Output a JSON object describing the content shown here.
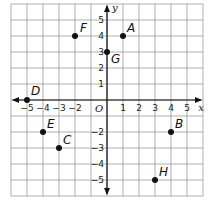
{
  "chart_data": {
    "type": "scatter",
    "title": "",
    "xlabel": "x",
    "ylabel": "y",
    "origin_label": "O",
    "xlim": [
      -6,
      6
    ],
    "ylim": [
      -6,
      6
    ],
    "grid": true,
    "x_ticks": [
      -5,
      -4,
      -3,
      -2,
      1,
      2,
      3,
      4,
      5
    ],
    "y_ticks": [
      5,
      4,
      3,
      2,
      1,
      -2,
      -3,
      -4,
      -5
    ],
    "points": [
      {
        "label": "A",
        "x": 1,
        "y": 4
      },
      {
        "label": "B",
        "x": 4,
        "y": -2
      },
      {
        "label": "C",
        "x": -3,
        "y": -3
      },
      {
        "label": "D",
        "x": -5,
        "y": 0
      },
      {
        "label": "E",
        "x": -4,
        "y": -2
      },
      {
        "label": "F",
        "x": -2,
        "y": 4
      },
      {
        "label": "G",
        "x": 0,
        "y": 3
      },
      {
        "label": "H",
        "x": 3,
        "y": -5
      }
    ]
  },
  "colors": {
    "grid": "#9a9a9a",
    "axis": "#111111",
    "point": "#111111"
  }
}
